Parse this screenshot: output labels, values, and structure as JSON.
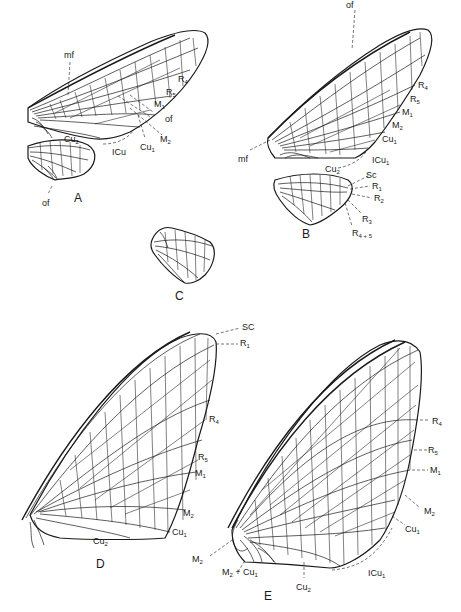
{
  "figure": {
    "line_color": "#1a1a1a",
    "background": "#ffffff"
  },
  "panels": {
    "A": {
      "label": "A",
      "forewing_labels": [
        "mf",
        "R4",
        "R5",
        "M1",
        "of",
        "M2",
        "Cu1",
        "ICu",
        "Cu2"
      ],
      "hindwing_labels": [
        "of"
      ]
    },
    "B": {
      "label": "B",
      "forewing_labels": [
        "of",
        "R4",
        "R5",
        "M1",
        "M2",
        "Cu1",
        "ICu1",
        "Cu2",
        "mf"
      ],
      "hindwing_labels": [
        "Sc",
        "R1",
        "R2",
        "R3",
        "R4+5"
      ]
    },
    "C": {
      "label": "C",
      "labels": []
    },
    "D": {
      "label": "D",
      "labels": [
        "SC",
        "R1",
        "R4",
        "R5",
        "M1",
        "M2",
        "Cu1",
        "Cu2"
      ]
    },
    "E": {
      "label": "E",
      "labels": [
        "R4",
        "R5",
        "M1",
        "M2",
        "Cu1",
        "ICu1",
        "Cu2",
        "M2",
        "M2 + Cu1"
      ]
    }
  },
  "text": {
    "A_mf": "mf",
    "A_R4": "R",
    "A_R4_sub": "4",
    "A_R5": "R",
    "A_R5_sub": "5",
    "A_M1": "M",
    "A_M1_sub": "1",
    "A_of": "of",
    "A_M2": "M",
    "A_M2_sub": "2",
    "A_Cu1": "Cu",
    "A_Cu1_sub": "1",
    "A_ICu": "ICu",
    "A_Cu2": "Cu",
    "A_Cu2_sub": "2",
    "A_hind_of": "of",
    "A_panel": "A",
    "B_of": "of",
    "B_R4": "R",
    "B_R4_sub": "4",
    "B_R5": "R",
    "B_R5_sub": "5",
    "B_M1": "M",
    "B_M1_sub": "1",
    "B_M2": "M",
    "B_M2_sub": "2",
    "B_Cu1": "Cu",
    "B_Cu1_sub": "1",
    "B_ICu1": "ICu",
    "B_ICu1_sub": "1",
    "B_Cu2": "Cu",
    "B_Cu2_sub": "2",
    "B_mf": "mf",
    "B_Sc": "Sc",
    "B_R1": "R",
    "B_R1_sub": "1",
    "B_R2": "R",
    "B_R2_sub": "2",
    "B_R3": "R",
    "B_R3_sub": "3",
    "B_R45": "R",
    "B_R45_sub": "4 + 5",
    "B_panel": "B",
    "C_panel": "C",
    "D_SC": "SC",
    "D_R1": "R",
    "D_R1_sub": "1",
    "D_R4": "R",
    "D_R4_sub": "4",
    "D_R5": "R",
    "D_R5_sub": "5",
    "D_M1": "M",
    "D_M1_sub": "1",
    "D_M2": "M",
    "D_M2_sub": "2",
    "D_Cu1": "Cu",
    "D_Cu1_sub": "1",
    "D_Cu2": "Cu",
    "D_Cu2_sub": "2",
    "D_panel": "D",
    "E_R4": "R",
    "E_R4_sub": "4",
    "E_R5": "R",
    "E_R5_sub": "5",
    "E_M1": "M",
    "E_M1_sub": "1",
    "E_M2": "M",
    "E_M2_sub": "2",
    "E_Cu1": "Cu",
    "E_Cu1_sub": "1",
    "E_ICu1": "ICu",
    "E_ICu1_sub": "1",
    "E_Cu2": "Cu",
    "E_Cu2_sub": "2",
    "E_M2b": "M",
    "E_M2b_sub": "2",
    "E_M2Cu1a": "M",
    "E_M2Cu1a_sub": "2",
    "E_M2Cu1b": " + Cu",
    "E_M2Cu1b_sub": "1",
    "E_panel": "E"
  }
}
